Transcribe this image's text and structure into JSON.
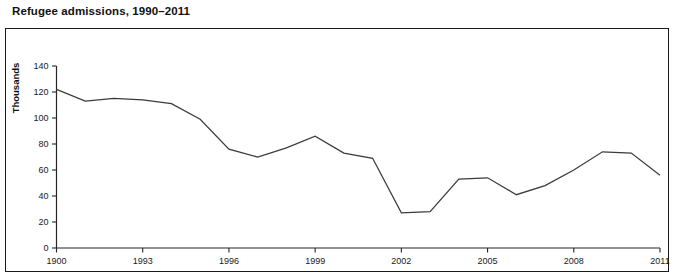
{
  "figure": {
    "title": "Refugee admissions, 1990–2011"
  },
  "chart_data": {
    "type": "line",
    "title": "Refugee admissions, 1990–2011",
    "xlabel": "",
    "ylabel": "Thousands",
    "grid": false,
    "legend": null,
    "xlim": [
      1990,
      2011
    ],
    "ylim": [
      0,
      140
    ],
    "ytick_values": [
      0,
      20,
      40,
      60,
      80,
      100,
      120,
      140
    ],
    "ytick_labels": [
      "0",
      "20",
      "40",
      "60",
      "80",
      "100",
      "120",
      "140"
    ],
    "xtick_values": [
      1990,
      1993,
      1996,
      1999,
      2002,
      2005,
      2008,
      2011
    ],
    "xtick_labels": [
      "1900",
      "1993",
      "1996",
      "1999",
      "2002",
      "2005",
      "2008",
      "2011"
    ],
    "x": [
      1990,
      1991,
      1992,
      1993,
      1994,
      1995,
      1996,
      1997,
      1998,
      1999,
      2000,
      2001,
      2002,
      2003,
      2004,
      2005,
      2006,
      2007,
      2008,
      2009,
      2010,
      2011
    ],
    "values": [
      122,
      113,
      115,
      114,
      111,
      99,
      76,
      70,
      77,
      86,
      73,
      69,
      27,
      28,
      53,
      54,
      41,
      48,
      60,
      74,
      73,
      56
    ],
    "series": [
      {
        "name": "Refugee admissions",
        "color": "#3b3b3b",
        "values": [
          122,
          113,
          115,
          114,
          111,
          99,
          76,
          70,
          77,
          86,
          73,
          69,
          27,
          28,
          53,
          54,
          41,
          48,
          60,
          74,
          73,
          56
        ]
      }
    ]
  },
  "axis": {
    "y_label": "Thousands"
  }
}
